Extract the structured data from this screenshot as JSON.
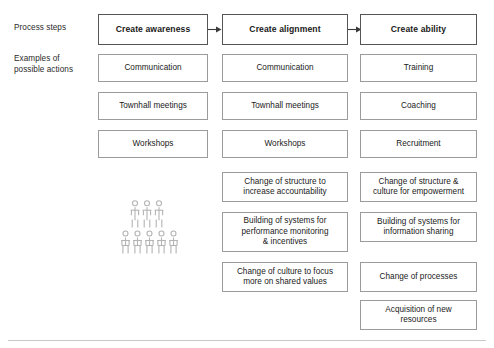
{
  "diagram": {
    "row_labels": [
      {
        "id": "process-steps",
        "text": "Process steps"
      },
      {
        "id": "examples-of-possible-actions",
        "text": "Examples of\npossible actions"
      }
    ],
    "columns": [
      {
        "id": "create-awareness",
        "header": "Create awareness",
        "items": [
          "Communication",
          "Townhall meetings",
          "Workshops"
        ]
      },
      {
        "id": "create-alignment",
        "header": "Create alignment",
        "items": [
          "Communication",
          "Townhall meetings",
          "Workshops",
          "Change of structure to\nincrease accountability",
          "Building of systems for\nperformance monitoring\n& incentives",
          "Change of culture to focus\nmore on shared values"
        ]
      },
      {
        "id": "create-ability",
        "header": "Create ability",
        "items": [
          "Training",
          "Coaching",
          "Recruitment",
          "Change of structure &\nculture for empowerment",
          "Building of systems for\ninformation sharing",
          "Change of processes",
          "Acquisition of new\nresources"
        ]
      }
    ],
    "arrows": [
      {
        "id": "arrow-awareness-to-alignment"
      },
      {
        "id": "arrow-alignment-to-ability"
      }
    ],
    "illustration": {
      "id": "people-group-icon",
      "figure_count": 8
    },
    "colors": {
      "box_border": "#9b9b9b",
      "header_border": "#555555",
      "text": "#1a1a1a",
      "illustration": "#b0b0b0",
      "baseline": "#c9c9c9"
    }
  }
}
